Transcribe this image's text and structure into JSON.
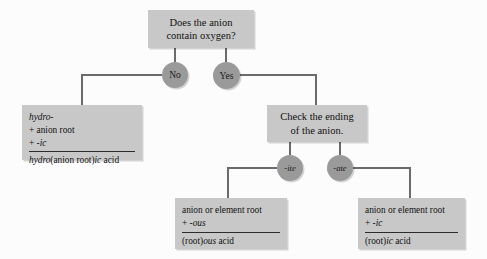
{
  "diagram": {
    "colors": {
      "background": "#fcfcfc",
      "box_fill": "#c8c8c8",
      "oval_fill": "#9a9a9a",
      "line": "#6b6b6b",
      "text": "#111111"
    },
    "question_node": {
      "line1": "Does the anion",
      "line2": "contain oxygen?"
    },
    "branch_labels": {
      "no": "No",
      "yes": "Yes",
      "ite": "-ite",
      "ate": "-ate"
    },
    "check_node": {
      "line1": "Check the ending",
      "line2": "of the anion."
    },
    "hydro_rule": {
      "line1_italic": "hydro-",
      "line2": "+ anion root",
      "line3_plus": "+ ",
      "line3_italic": "-ic",
      "result_italic1": "hydro",
      "result_plain1": "(anion root)",
      "result_italic2": "ic",
      "result_plain2": " acid"
    },
    "ous_rule": {
      "line1": "anion or element root",
      "line2_plus": "+ ",
      "line2_italic": "-ous",
      "result_plain1": "(root)",
      "result_italic": "ous",
      "result_plain2": " acid"
    },
    "ic_rule": {
      "line1": "anion or element root",
      "line2_plus": "+ ",
      "line2_italic": "-ic",
      "result_plain1": "(root)",
      "result_italic": "ic",
      "result_plain2": " acid"
    }
  }
}
